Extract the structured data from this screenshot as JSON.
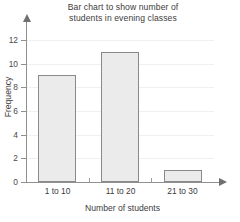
{
  "chart_data": {
    "type": "bar",
    "title": "Bar chart to show number of students in evening classes",
    "title_line1": "Bar chart to show number of",
    "title_line2": "students in evening classes",
    "categories": [
      "1 to 10",
      "11 to 20",
      "21 to 30"
    ],
    "values": [
      9,
      11,
      1
    ],
    "xlabel": "Number of students",
    "ylabel": "Frequency",
    "ylim": [
      0,
      13
    ],
    "ytick_labels": [
      "0",
      "2",
      "4",
      "6",
      "8",
      "10",
      "12"
    ],
    "ytick_values": [
      0,
      2,
      4,
      6,
      8,
      10,
      12
    ],
    "grid": true,
    "legend": false,
    "bar_fill_color": "#ebebeb",
    "bar_edge_color": "#8a8a8a",
    "axis_color": "#8f8f8f",
    "grid_color": "#f0f0f0",
    "background_color": "#ffffff"
  }
}
